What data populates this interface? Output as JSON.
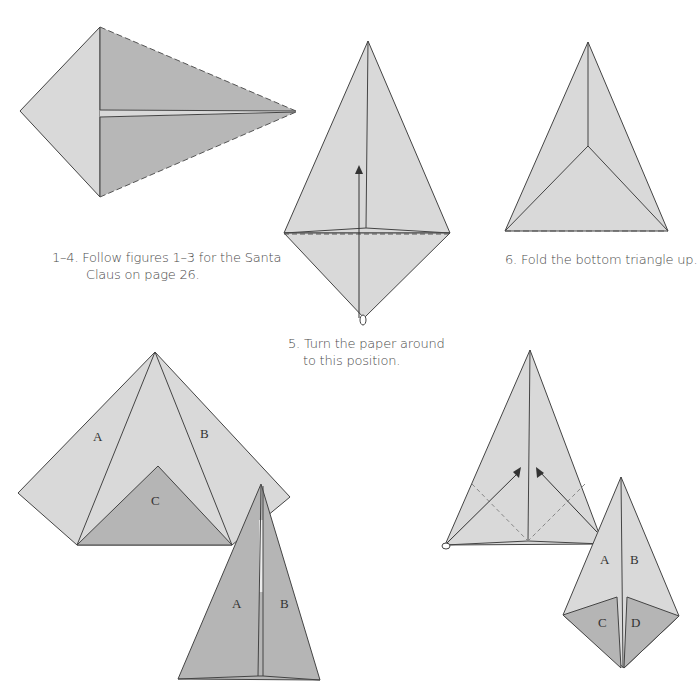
{
  "colors": {
    "paper_light": "#d9d9d9",
    "paper_dark": "#b3b3b3",
    "paper_mid": "#c4c4c4",
    "line": "#444444",
    "dashed": "#555555",
    "text": "#4a4a4a"
  },
  "steps": [
    {
      "id": "1-4",
      "caption_line1": "1–4. Follow figures 1–3 for the Santa",
      "caption_line2": "Claus on page 26."
    },
    {
      "id": "5",
      "caption_line1": "5. Turn the paper around",
      "caption_line2": "to this position."
    },
    {
      "id": "6",
      "caption_line1": "6. Fold the bottom triangle up.",
      "caption_line2": ""
    }
  ],
  "labels": {
    "fig7_a": "A",
    "fig7_b": "B",
    "fig7_c": "C",
    "fig8_a": "A",
    "fig8_b": "B",
    "fig10_a": "A",
    "fig10_b": "B",
    "fig10_c": "C",
    "fig10_d": "D"
  }
}
